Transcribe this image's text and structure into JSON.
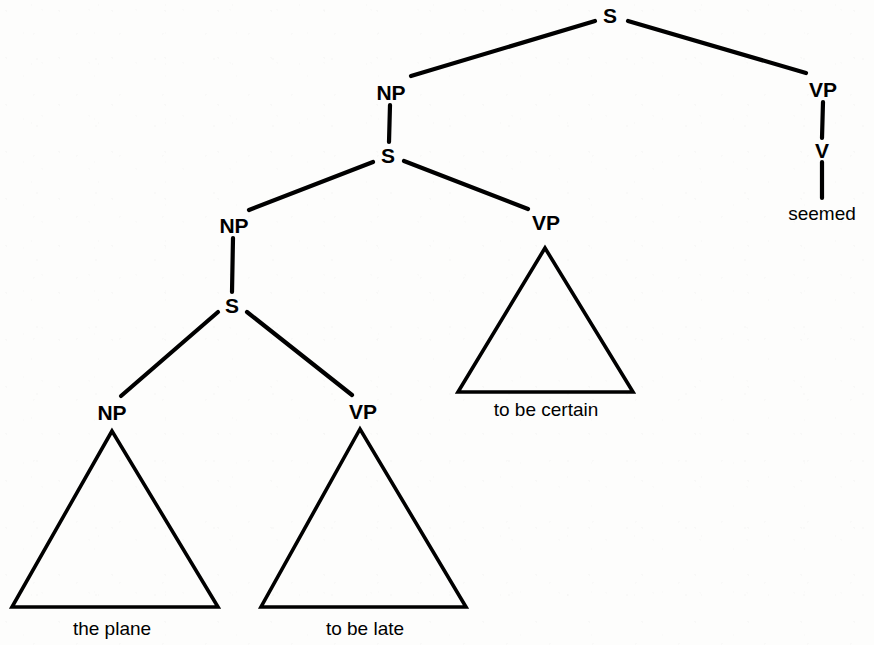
{
  "figure": {
    "kind": "syntactic-phrase-structure-tree",
    "sentence": "the plane seemed to be late to be certain",
    "background_color": "#fdfdfc",
    "ink_color": "#000000"
  },
  "nodes": {
    "s_top": {
      "label": "S",
      "x": 610,
      "y": 15
    },
    "np_l1": {
      "label": "NP",
      "x": 391,
      "y": 92
    },
    "vp_right": {
      "label": "VP",
      "x": 823,
      "y": 89
    },
    "v_right": {
      "label": "V",
      "x": 822,
      "y": 150
    },
    "s_l2": {
      "label": "S",
      "x": 388,
      "y": 155
    },
    "np_l2": {
      "label": "NP",
      "x": 234,
      "y": 225
    },
    "vp_l2": {
      "label": "VP",
      "x": 546,
      "y": 222
    },
    "s_l3": {
      "label": "S",
      "x": 232,
      "y": 305
    },
    "np_l3": {
      "label": "NP",
      "x": 112,
      "y": 412
    },
    "vp_l3": {
      "label": "VP",
      "x": 363,
      "y": 411
    }
  },
  "terminals": {
    "seemed": {
      "label": "seemed",
      "x": 822,
      "y": 213
    },
    "to_be_certain": {
      "label": "to be certain",
      "x": 546,
      "y": 409
    },
    "the_plane": {
      "label": "the plane",
      "x": 112,
      "y": 628
    },
    "to_be_late": {
      "label": "to be late",
      "x": 365,
      "y": 628
    }
  },
  "triangles": {
    "to_be_certain": {
      "apex_x": 545,
      "apex_y": 248,
      "left_x": 458,
      "right_x": 633,
      "base_y": 392
    },
    "the_plane": {
      "apex_x": 112,
      "apex_y": 431,
      "left_x": 12,
      "right_x": 218,
      "base_y": 607
    },
    "to_be_late": {
      "apex_x": 360,
      "apex_y": 429,
      "left_x": 261,
      "right_x": 466,
      "base_y": 607
    }
  },
  "branches": [
    {
      "name": "s-top-to-np",
      "x1": 595,
      "y1": 21,
      "x2": 411,
      "y2": 76
    },
    {
      "name": "s-top-to-vp-right",
      "x1": 628,
      "y1": 21,
      "x2": 806,
      "y2": 73
    },
    {
      "name": "np-l1-to-s-l2",
      "x1": 390,
      "y1": 105,
      "x2": 389,
      "y2": 142
    },
    {
      "name": "vp-right-to-v",
      "x1": 823,
      "y1": 102,
      "x2": 822,
      "y2": 138
    },
    {
      "name": "v-to-seemed",
      "x1": 822,
      "y1": 162,
      "x2": 822,
      "y2": 198
    },
    {
      "name": "s-l2-to-np-l2",
      "x1": 373,
      "y1": 162,
      "x2": 249,
      "y2": 210
    },
    {
      "name": "s-l2-to-vp-l2",
      "x1": 404,
      "y1": 161,
      "x2": 528,
      "y2": 209
    },
    {
      "name": "np-l2-to-s-l3",
      "x1": 233,
      "y1": 238,
      "x2": 232,
      "y2": 292
    },
    {
      "name": "s-l3-to-np-l3",
      "x1": 218,
      "y1": 312,
      "x2": 121,
      "y2": 396
    },
    {
      "name": "s-l3-to-vp-l3",
      "x1": 247,
      "y1": 312,
      "x2": 352,
      "y2": 395
    }
  ],
  "style": {
    "branch_stroke_width": 4.2,
    "triangle_stroke_width": 3.6,
    "node_font_size": 21,
    "terminal_font_size": 19
  }
}
